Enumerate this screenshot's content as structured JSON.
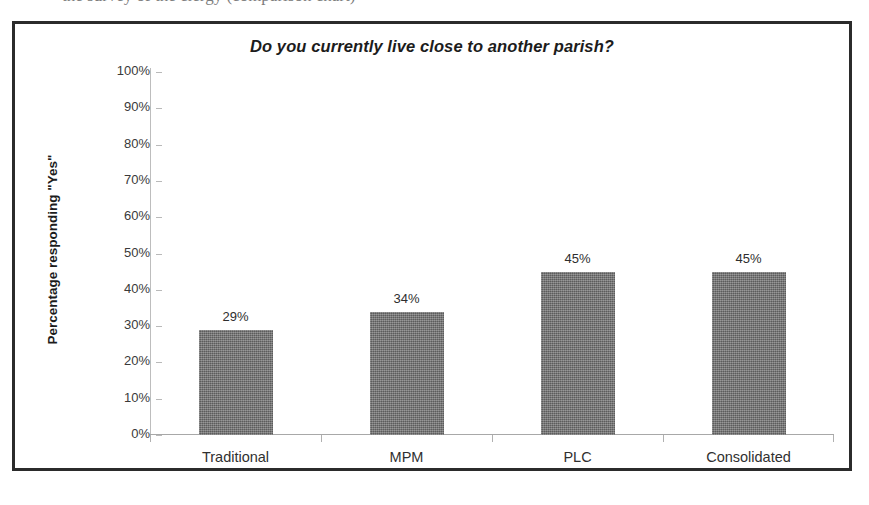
{
  "page": {
    "cut_off_text_above": "the survey of the clergy (comparison chart)"
  },
  "chart_frame": {
    "border_color": "#2b2b2b"
  },
  "chart_data": {
    "type": "bar",
    "title": "Do you currently live close to another parish?",
    "xlabel": "",
    "ylabel": "Percentage responding \"Yes\"",
    "categories": [
      "Traditional",
      "MPM",
      "PLC",
      "Consolidated"
    ],
    "values": [
      29,
      34,
      45,
      45
    ],
    "value_labels": [
      "29%",
      "34%",
      "45%",
      "45%"
    ],
    "ylim": [
      0,
      100
    ],
    "ytick_values": [
      0,
      10,
      20,
      30,
      40,
      50,
      60,
      70,
      80,
      90,
      100
    ],
    "ytick_labels": [
      "0%",
      "10%",
      "20%",
      "30%",
      "40%",
      "50%",
      "60%",
      "70%",
      "80%",
      "90%",
      "100%"
    ],
    "grid": false,
    "legend": false,
    "legend_position": "none",
    "bar_color": "#6f6f6f",
    "axis_color": "#b9b9b9",
    "text_color": "#2e2e2e"
  }
}
